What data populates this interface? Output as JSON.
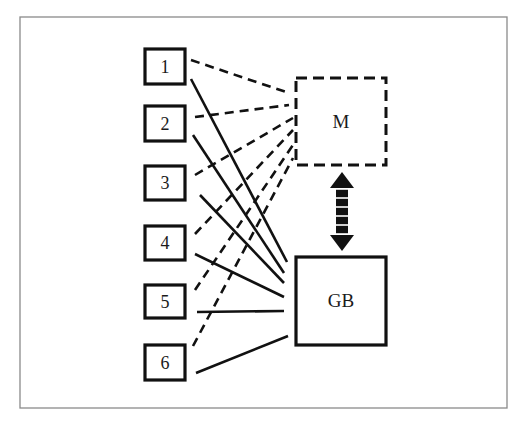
{
  "diagram": {
    "type": "network",
    "frame": {
      "x": 20,
      "y": 17,
      "width": 487,
      "height": 391,
      "stroke": "#8a8a8a"
    },
    "colors": {
      "ink": "#111111",
      "frame": "#8a8a8a",
      "background": "#ffffff"
    },
    "nodes": [
      {
        "id": "1",
        "label": "1",
        "x": 145,
        "y": 49,
        "w": 40,
        "h": 35,
        "style": "solid"
      },
      {
        "id": "2",
        "label": "2",
        "x": 145,
        "y": 106,
        "w": 40,
        "h": 35,
        "style": "solid"
      },
      {
        "id": "3",
        "label": "3",
        "x": 145,
        "y": 166,
        "w": 40,
        "h": 34,
        "style": "solid"
      },
      {
        "id": "4",
        "label": "4",
        "x": 145,
        "y": 226,
        "w": 40,
        "h": 34,
        "style": "solid"
      },
      {
        "id": "5",
        "label": "5",
        "x": 145,
        "y": 285,
        "w": 40,
        "h": 33,
        "style": "solid"
      },
      {
        "id": "6",
        "label": "6",
        "x": 145,
        "y": 345,
        "w": 40,
        "h": 35,
        "style": "solid"
      },
      {
        "id": "M",
        "label": "M",
        "x": 296,
        "y": 78,
        "w": 90,
        "h": 87,
        "style": "dashed"
      },
      {
        "id": "GB",
        "label": "GB",
        "x": 296,
        "y": 257,
        "w": 90,
        "h": 88,
        "style": "solid"
      }
    ],
    "edges": [
      {
        "from": "1",
        "to": "M",
        "style": "dashed",
        "x1": 191,
        "y1": 60,
        "x2": 289,
        "y2": 93
      },
      {
        "from": "2",
        "to": "M",
        "style": "dashed",
        "x1": 195,
        "y1": 117,
        "x2": 289,
        "y2": 105
      },
      {
        "from": "3",
        "to": "M",
        "style": "dashed",
        "x1": 195,
        "y1": 175,
        "x2": 293,
        "y2": 118
      },
      {
        "from": "4",
        "to": "M",
        "style": "dashed",
        "x1": 195,
        "y1": 234,
        "x2": 293,
        "y2": 130
      },
      {
        "from": "5",
        "to": "M",
        "style": "dashed",
        "x1": 195,
        "y1": 290,
        "x2": 293,
        "y2": 145
      },
      {
        "from": "6",
        "to": "M",
        "style": "dashed",
        "x1": 193,
        "y1": 346,
        "x2": 293,
        "y2": 158
      },
      {
        "from": "1",
        "to": "GB",
        "style": "solid",
        "x1": 191,
        "y1": 79,
        "x2": 287,
        "y2": 262
      },
      {
        "from": "2",
        "to": "GB",
        "style": "solid",
        "x1": 193,
        "y1": 135,
        "x2": 284,
        "y2": 273
      },
      {
        "from": "3",
        "to": "GB",
        "style": "solid",
        "x1": 200,
        "y1": 195,
        "x2": 284,
        "y2": 283
      },
      {
        "from": "4",
        "to": "GB",
        "style": "solid",
        "x1": 195,
        "y1": 254,
        "x2": 284,
        "y2": 297
      },
      {
        "from": "5",
        "to": "GB",
        "style": "solid",
        "x1": 197,
        "y1": 312,
        "x2": 284,
        "y2": 311
      },
      {
        "from": "6",
        "to": "GB",
        "style": "solid",
        "x1": 196,
        "y1": 373,
        "x2": 288,
        "y2": 336
      }
    ],
    "link": {
      "from": "M",
      "to": "GB",
      "style": "double-arrow",
      "x": 342,
      "y1": 172,
      "y2": 251
    }
  }
}
